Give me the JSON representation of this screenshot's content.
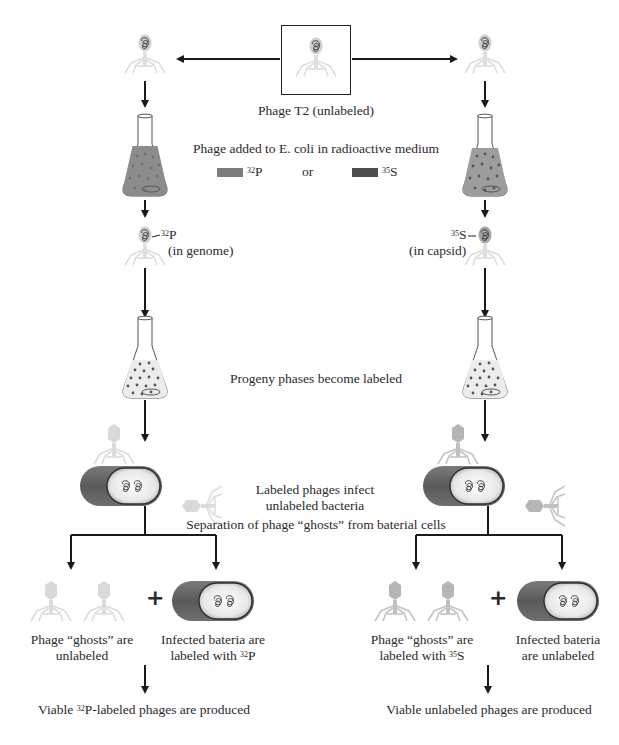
{
  "diagram": {
    "title_box_label": "Phage T2 (unlabeled)",
    "step_medium": "Phage added to E. coli in radioactive medium",
    "legend": {
      "p32": {
        "isotope": "32",
        "element": "P",
        "color": "#7d7d7d"
      },
      "or": "or",
      "s35": {
        "isotope": "35",
        "element": "S",
        "color": "#4e4e4e"
      }
    },
    "left_branch": {
      "label_isotope": "32",
      "label_element": "P",
      "label_location": "(in genome)",
      "ghosts_line1": "Phage “ghosts” are",
      "ghosts_line2": "unlabeled",
      "bacteria_line1": "Infected bateria are",
      "bacteria_line2_prefix": "labeled with ",
      "bacteria_line2_isotope": "32",
      "bacteria_line2_element": "P",
      "result_prefix": "Viable ",
      "result_isotope": "32",
      "result_suffix": "P-labeled phages are produced"
    },
    "right_branch": {
      "label_isotope": "35",
      "label_element": "S",
      "label_location": "(in capsid)",
      "ghosts_line1": "Phage “ghosts” are",
      "ghosts_line2_prefix": "labeled with ",
      "ghosts_line2_isotope": "35",
      "ghosts_line2_element": "S",
      "bacteria_line1": "Infected bateria",
      "bacteria_line2": "are unlabeled",
      "result": "Viable unlabeled phages are produced"
    },
    "step_progeny": "Progeny phases become labeled",
    "step_infect_line1": "Labeled phages infect",
    "step_infect_line2": "unlabeled bacteria",
    "step_separation": "Separation of phage “ghosts” from baterial cells",
    "plus": "+",
    "colors": {
      "phage_light": "#d6d6d6",
      "phage_medium": "#b3b3b3",
      "flask_p32": "#8a8a8a",
      "flask_s35": "#9a9a9a",
      "flask_progeny": "#e6e6e6",
      "bacteria_outer": "#6a6a6a",
      "arrow": "#1a1a1a"
    }
  }
}
